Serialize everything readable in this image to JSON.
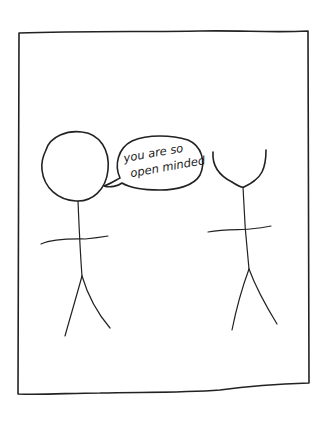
{
  "comic": {
    "panel": {
      "border_color": "#222222",
      "background": "#ffffff"
    },
    "characters": [
      {
        "name": "left-figure",
        "head": "round"
      },
      {
        "name": "right-figure",
        "head": "open-cup"
      }
    ],
    "speech_bubble": {
      "speaker": "left-figure",
      "lines": [
        "you are so",
        "open minded"
      ]
    }
  }
}
